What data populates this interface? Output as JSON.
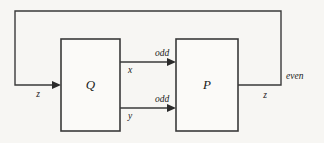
{
  "diagram": {
    "type": "block-diagram",
    "canvas": {
      "width": 324,
      "height": 143,
      "background": "#f7f6f3"
    },
    "stroke_color": "#3a3a3a",
    "text_color": "#1a1a1a",
    "nodes": [
      {
        "id": "Q",
        "label": "Q",
        "x": 61,
        "y": 39,
        "width": 59,
        "height": 92
      },
      {
        "id": "P",
        "label": "P",
        "x": 176,
        "y": 39,
        "width": 62,
        "height": 92
      }
    ],
    "edges": [
      {
        "id": "input-z",
        "label": "z",
        "from": "feedback",
        "to": "Q",
        "label_x": 38,
        "label_y": 95
      },
      {
        "id": "q-to-p-upper",
        "label": "odd",
        "variable": "x",
        "from": "Q",
        "to": "P",
        "label_x": 162,
        "label_y": 54,
        "variable_x": 130,
        "variable_y": 71
      },
      {
        "id": "q-to-p-lower",
        "label": "odd",
        "variable": "y",
        "from": "Q",
        "to": "P",
        "label_x": 162,
        "label_y": 100,
        "variable_x": 130,
        "variable_y": 117
      },
      {
        "id": "output-even",
        "label": "even",
        "variable": "z",
        "from": "P",
        "to": "feedback",
        "label_x": 286,
        "label_y": 77,
        "variable_x": 265,
        "variable_y": 96
      }
    ]
  }
}
